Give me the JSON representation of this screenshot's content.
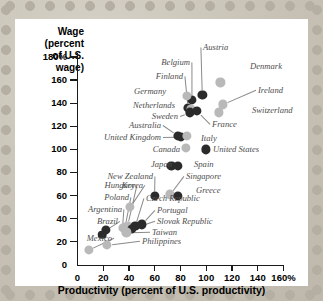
{
  "chart_data": {
    "type": "scatter",
    "title": "",
    "xlabel": "Productivity (percent of U.S. productivity)",
    "ylabel": "Wage (percent of U.S. wage)",
    "ylabel_lines": [
      "Wage (percent",
      "of U.S. wage)"
    ],
    "xlim": [
      0,
      160
    ],
    "ylim": [
      0,
      180
    ],
    "xticks": [
      0,
      20,
      40,
      60,
      80,
      100,
      120,
      140,
      160
    ],
    "xtick_labels": [
      "0",
      "20",
      "40",
      "60",
      "80",
      "100",
      "120",
      "140",
      "160%"
    ],
    "yticks": [
      0,
      20,
      40,
      60,
      80,
      100,
      120,
      140,
      160,
      180
    ],
    "ytick_labels": [
      "0",
      "20",
      "40",
      "60",
      "80",
      "100",
      "120",
      "140",
      "160",
      "180%"
    ],
    "grid": false,
    "legend": "none",
    "points": [
      {
        "name": "Austria",
        "x": 97,
        "y": 147,
        "shade": "dark",
        "r": 4.6,
        "lx": 203,
        "ly": 47,
        "side": "l",
        "leader": true
      },
      {
        "name": "Belgium",
        "x": 89,
        "y": 143,
        "shade": "dark",
        "r": 4.6,
        "lx": 190,
        "ly": 62,
        "side": "r",
        "leader": true
      },
      {
        "name": "Denmark",
        "x": 111,
        "y": 158,
        "shade": "light",
        "r": 4.6,
        "lx": 250,
        "ly": 66,
        "side": "l",
        "leader": false
      },
      {
        "name": "Finland",
        "x": 86,
        "y": 136,
        "shade": "dark",
        "r": 4.6,
        "lx": 183,
        "ly": 76,
        "side": "r",
        "leader": true
      },
      {
        "name": "Ireland",
        "x": 113,
        "y": 139,
        "shade": "light",
        "r": 4.6,
        "lx": 258,
        "ly": 90,
        "side": "l",
        "leader": true
      },
      {
        "name": "Germany",
        "x": 85,
        "y": 146,
        "shade": "light",
        "r": 4.6,
        "lx": 166,
        "ly": 91,
        "side": "r",
        "leader": false
      },
      {
        "name": "Netherlands",
        "x": 88,
        "y": 135,
        "shade": "light",
        "r": 4.6,
        "lx": 175,
        "ly": 105,
        "side": "r",
        "leader": false
      },
      {
        "name": "Switzerland",
        "x": 110,
        "y": 132,
        "shade": "light",
        "r": 4.6,
        "lx": 252,
        "ly": 110,
        "side": "l",
        "leader": false
      },
      {
        "name": "Sweden",
        "x": 87,
        "y": 132,
        "shade": "dark",
        "r": 4.6,
        "lx": 178,
        "ly": 116,
        "side": "r",
        "leader": true
      },
      {
        "name": "France",
        "x": 93,
        "y": 133,
        "shade": "dark",
        "r": 4.6,
        "lx": 212,
        "ly": 124,
        "side": "l",
        "leader": true
      },
      {
        "name": "Australia",
        "x": 78,
        "y": 112,
        "shade": "dark",
        "r": 4.6,
        "lx": 161,
        "ly": 125,
        "side": "r",
        "leader": true
      },
      {
        "name": "United Kingdom",
        "x": 80,
        "y": 111,
        "shade": "dark",
        "r": 4.6,
        "lx": 161,
        "ly": 137,
        "side": "r",
        "leader": true
      },
      {
        "name": "Italy",
        "x": 85,
        "y": 112,
        "shade": "light",
        "r": 4.6,
        "lx": 201,
        "ly": 138,
        "side": "l",
        "leader": false
      },
      {
        "name": "Canada",
        "x": 84,
        "y": 101,
        "shade": "light",
        "r": 4.6,
        "lx": 180,
        "ly": 149,
        "side": "r",
        "leader": false
      },
      {
        "name": "United States",
        "x": 100,
        "y": 100,
        "shade": "dark",
        "r": 4.6,
        "lx": 213,
        "ly": 149,
        "side": "l",
        "leader": false
      },
      {
        "name": "Japan",
        "x": 73,
        "y": 86,
        "shade": "dark",
        "r": 4.6,
        "lx": 172,
        "ly": 164,
        "side": "r",
        "leader": true
      },
      {
        "name": "Spain",
        "x": 78,
        "y": 86,
        "shade": "dark",
        "r": 4.6,
        "lx": 194,
        "ly": 164,
        "side": "l",
        "leader": false
      },
      {
        "name": "Singapore",
        "x": 72,
        "y": 61,
        "shade": "light",
        "r": 4.6,
        "lx": 186,
        "ly": 176,
        "side": "l",
        "leader": true
      },
      {
        "name": "Greece",
        "x": 78,
        "y": 60,
        "shade": "dark",
        "r": 4.6,
        "lx": 196,
        "ly": 190,
        "side": "l",
        "leader": false
      },
      {
        "name": "New Zealand",
        "x": 60,
        "y": 60,
        "shade": "dark",
        "r": 4.6,
        "lx": 153,
        "ly": 176,
        "side": "r",
        "leader": true
      },
      {
        "name": "Hungary",
        "x": 39,
        "y": 34,
        "shade": "light",
        "r": 4.6,
        "lx": 135,
        "ly": 185,
        "side": "r",
        "leader": true
      },
      {
        "name": "Korea",
        "x": 41,
        "y": 50,
        "shade": "light",
        "r": 4.6,
        "lx": 143,
        "ly": 185,
        "side": "r",
        "leader": true
      },
      {
        "name": "Czech Republic",
        "x": 45,
        "y": 34,
        "shade": "dark",
        "r": 4.6,
        "lx": 146,
        "ly": 198,
        "side": "l",
        "leader": true
      },
      {
        "name": "Poland",
        "x": 37,
        "y": 33,
        "shade": "light",
        "r": 4.6,
        "lx": 129,
        "ly": 197,
        "side": "r",
        "leader": true
      },
      {
        "name": "Argentina",
        "x": 35,
        "y": 32,
        "shade": "light",
        "r": 4.6,
        "lx": 122,
        "ly": 209,
        "side": "r",
        "leader": true
      },
      {
        "name": "Portugal",
        "x": 50,
        "y": 35,
        "shade": "dark",
        "r": 4.6,
        "lx": 157,
        "ly": 210,
        "side": "l",
        "leader": true
      },
      {
        "name": "Brazil",
        "x": 22,
        "y": 30,
        "shade": "dark",
        "r": 4.6,
        "lx": 118,
        "ly": 221,
        "side": "r",
        "leader": true
      },
      {
        "name": "Slovak Republic",
        "x": 42,
        "y": 31,
        "shade": "dark",
        "r": 4.6,
        "lx": 157,
        "ly": 221,
        "side": "l",
        "leader": true
      },
      {
        "name": "Taiwan",
        "x": 38,
        "y": 28,
        "shade": "light",
        "r": 4.6,
        "lx": 152,
        "ly": 232,
        "side": "l",
        "leader": true
      },
      {
        "name": "Mexico",
        "x": 9,
        "y": 13,
        "shade": "light",
        "r": 4.6,
        "lx": 112,
        "ly": 238,
        "side": "r",
        "leader": true
      },
      {
        "name": "Philippines",
        "x": 23,
        "y": 17,
        "shade": "light",
        "r": 4.6,
        "lx": 142,
        "ly": 241,
        "side": "l",
        "leader": true
      },
      {
        "name": "extra-brazil-2",
        "x": 19,
        "y": 26,
        "shade": "dark",
        "r": 4.3,
        "lx": 0,
        "ly": 0,
        "side": "l",
        "leader": false,
        "nolabel": true
      }
    ]
  },
  "decor": {
    "background_color": "#c6c1b4",
    "card_color": "#ffffff",
    "dot_dark": "#2b2b2b",
    "dot_light": "#b9b9b9",
    "axis_color": "#1a1a1a",
    "label_color": "#4d4d4d"
  }
}
